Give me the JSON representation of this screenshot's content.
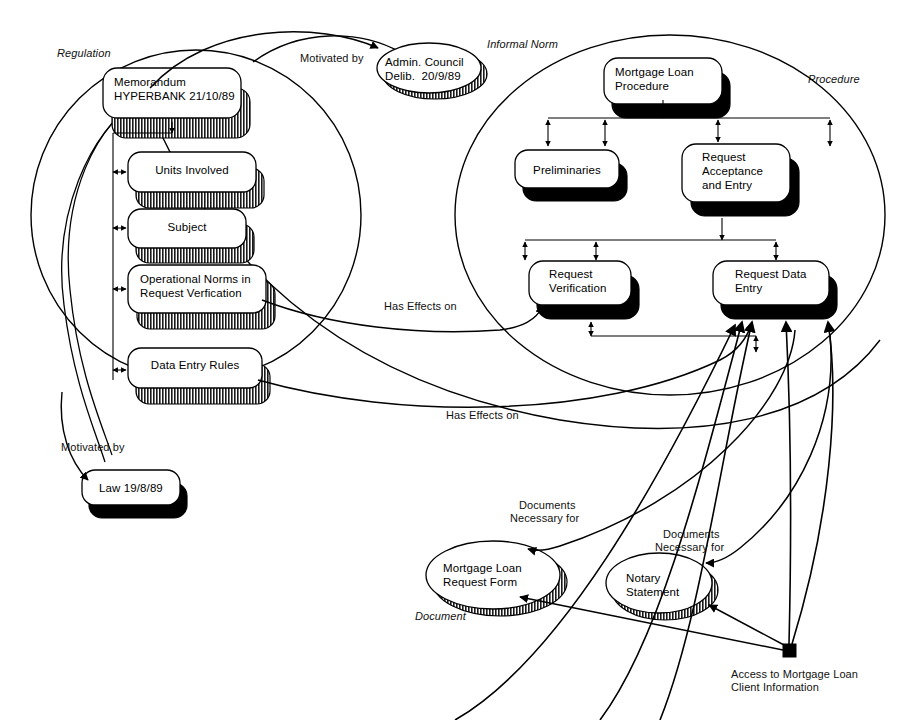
{
  "diagram": {
    "groups": [
      {
        "id": "regulation",
        "label": "Regulation"
      },
      {
        "id": "informal-norm",
        "label": "Informal Norm"
      },
      {
        "id": "procedure",
        "label": "Procedure"
      },
      {
        "id": "document",
        "label": "Document"
      }
    ],
    "nodes": {
      "memorandum": {
        "label": "Memorandum\nHYPERBANK 21/10/89",
        "shape": "rounded-rect",
        "shadow": "hatched"
      },
      "units_involved": {
        "label": "Units Involved",
        "shape": "rounded-rect",
        "shadow": "hatched"
      },
      "subject": {
        "label": "Subject",
        "shape": "rounded-rect",
        "shadow": "hatched"
      },
      "operational_norms": {
        "label": "Operational Norms in\nRequest Verfication",
        "shape": "rounded-rect",
        "shadow": "hatched"
      },
      "data_entry_rules": {
        "label": "Data Entry Rules",
        "shape": "rounded-rect",
        "shadow": "hatched"
      },
      "law": {
        "label": "Law 19/8/89",
        "shape": "rounded-rect",
        "shadow": "solid"
      },
      "admin_council": {
        "label": "Admin. Council\nDelib.  20/9/89",
        "shape": "ellipse",
        "shadow": "hatched"
      },
      "mortgage_loan_procedure": {
        "label": "Mortgage Loan\nProcedure",
        "shape": "rounded-rect",
        "shadow": "solid"
      },
      "preliminaries": {
        "label": "Preliminaries",
        "shape": "rounded-rect",
        "shadow": "solid"
      },
      "request_acceptance": {
        "label": "Request\nAcceptance\nand Entry",
        "shape": "rounded-rect",
        "shadow": "solid"
      },
      "request_verification": {
        "label": "Request\nVerification",
        "shape": "rounded-rect",
        "shadow": "solid"
      },
      "request_data_entry": {
        "label": "Request Data\nEntry",
        "shape": "rounded-rect",
        "shadow": "solid"
      },
      "mortgage_request_form": {
        "label": "Mortgage Loan\nRequest Form",
        "shape": "ellipse",
        "shadow": "hatched"
      },
      "notary_statement": {
        "label": "Notary\nStatement",
        "shape": "ellipse",
        "shadow": "hatched"
      },
      "access_node": {
        "label": "Access to Mortgage Loan\nClient Information",
        "shape": "filled-square",
        "shadow": "none"
      }
    },
    "edge_labels": [
      {
        "id": "motivated-by-admin",
        "text": "Motivated by"
      },
      {
        "id": "motivated-by-law",
        "text": "Motivated by"
      },
      {
        "id": "has-effects-on-1",
        "text": "Has Effects on"
      },
      {
        "id": "has-effects-on-2",
        "text": "Has Effects on"
      },
      {
        "id": "documents-necessary-1",
        "text": "Documents\nNecessary for"
      },
      {
        "id": "documents-necessary-2",
        "text": "Documents\nNecessary for"
      }
    ],
    "node_text": {
      "memorandum_line1": "Memorandum",
      "memorandum_line2": "HYPERBANK 21/10/89",
      "units_involved": "Units Involved",
      "subject": "Subject",
      "operational_norms_line1": "Operational Norms in",
      "operational_norms_line2": "Request Verfication",
      "data_entry_rules": "Data Entry Rules",
      "law": "Law 19/8/89",
      "admin_line1": "Admin. Council",
      "admin_line2": "Delib.  20/9/89",
      "mlp_line1": "Mortgage Loan",
      "mlp_line2": "Procedure",
      "preliminaries": "Preliminaries",
      "ra_line1": "Request",
      "ra_line2": "Acceptance",
      "ra_line3": "and Entry",
      "rv_line1": "Request",
      "rv_line2": "Verification",
      "rde_line1": "Request Data",
      "rde_line2": "Entry",
      "mrf_line1": "Mortgage Loan",
      "mrf_line2": "Request Form",
      "ns_line1": "Notary",
      "ns_line2": "Statement",
      "access_line1": "Access to Mortgage Loan",
      "access_line2": "Client Information"
    },
    "group_labels": {
      "regulation": "Regulation",
      "informal_norm": "Informal Norm",
      "procedure": "Procedure",
      "document": "Document"
    },
    "edge_label_text": {
      "motivated_by_admin": "Motivated by",
      "motivated_by_law": "Motivated by",
      "has_effects_1": "Has Effects on",
      "has_effects_2": "Has Effects on",
      "docs_nec_1_line1": "Documents",
      "docs_nec_1_line2": "Necessary for",
      "docs_nec_2_line1": "Documents",
      "docs_nec_2_line2": "Necessary for"
    },
    "colors": {
      "stroke": "#000000",
      "fill": "#ffffff",
      "shadow_solid": "#000000",
      "background": "#ffffff"
    }
  }
}
